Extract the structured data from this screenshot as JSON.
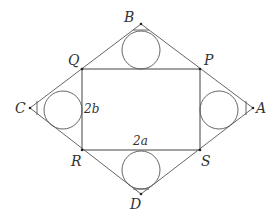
{
  "diagram": {
    "vertices": {
      "A": {
        "label": "A",
        "x": 253,
        "y": 108
      },
      "B": {
        "label": "B",
        "x": 141,
        "y": 24
      },
      "C": {
        "label": "C",
        "x": 30,
        "y": 108
      },
      "D": {
        "label": "D",
        "x": 141,
        "y": 194
      },
      "P": {
        "label": "P",
        "x": 200,
        "y": 69
      },
      "Q": {
        "label": "Q",
        "x": 82,
        "y": 69
      },
      "R": {
        "label": "R",
        "x": 82,
        "y": 150
      },
      "S": {
        "label": "S",
        "x": 200,
        "y": 150
      }
    },
    "dimensions": {
      "width_label": "2a",
      "height_label": "2b"
    },
    "circles": [
      {
        "name": "top",
        "cx": 141,
        "cy": 50,
        "r": 19
      },
      {
        "name": "bottom",
        "cx": 141,
        "cy": 170,
        "r": 19
      },
      {
        "name": "left",
        "cx": 63,
        "cy": 110,
        "r": 19
      },
      {
        "name": "right",
        "cx": 219,
        "cy": 110,
        "r": 19
      }
    ],
    "colors": {
      "stroke": "#555555",
      "label": "#333333",
      "background": "#ffffff"
    }
  }
}
